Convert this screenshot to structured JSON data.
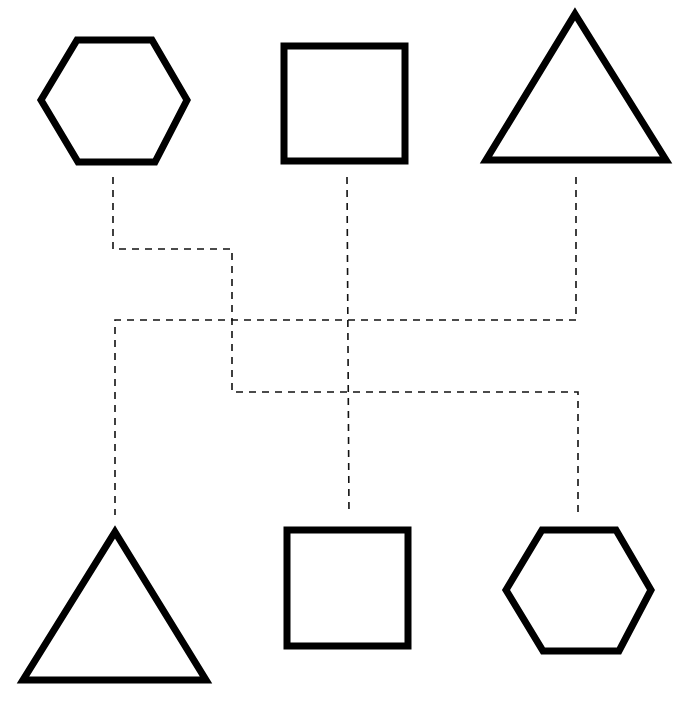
{
  "diagram": {
    "type": "shape-matching",
    "colors": {
      "background": "#ffffff",
      "shape_stroke": "#000000",
      "connector_stroke": "#111111"
    },
    "top_row": [
      {
        "id": "top-hexagon",
        "shape": "hexagon",
        "points": "41,100 77,40 152,40 187,100 155,162 78,162"
      },
      {
        "id": "top-square",
        "shape": "square",
        "points": "284,46 405,46 405,161 284,161"
      },
      {
        "id": "top-triangle",
        "shape": "triangle",
        "points": "575,14 666,160 486,160"
      }
    ],
    "bottom_row": [
      {
        "id": "bottom-triangle",
        "shape": "triangle",
        "points": "115,532 206,680 23,680"
      },
      {
        "id": "bottom-square",
        "shape": "square",
        "points": "287,530 408,530 408,646 287,646"
      },
      {
        "id": "bottom-hexagon",
        "shape": "hexagon",
        "points": "506,590 542,530 616,530 651,590 619,651 543,651"
      }
    ],
    "connectors": [
      {
        "id": "hexagon-connector",
        "from": "top-hexagon",
        "to": "bottom-hexagon",
        "points": "113,177 113,249 232,249 232,392 578,392 578,515"
      },
      {
        "id": "square-connector",
        "from": "top-square",
        "to": "bottom-square",
        "points": "347,177 349,515"
      },
      {
        "id": "triangle-connector",
        "from": "top-triangle",
        "to": "bottom-triangle",
        "points": "576,177 576,320 115,320 115,515"
      }
    ]
  }
}
